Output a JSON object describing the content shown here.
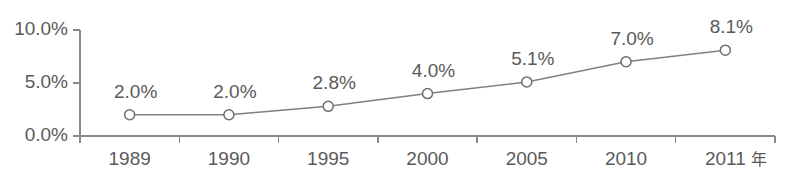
{
  "chart_data": {
    "type": "line",
    "title": "",
    "subtitle": "",
    "xlabel": "",
    "ylabel": "",
    "categories": [
      "1989",
      "1990",
      "1995",
      "2000",
      "2005",
      "2010",
      "2011"
    ],
    "values": [
      2.0,
      2.0,
      2.8,
      4.0,
      5.1,
      7.0,
      8.1
    ],
    "point_labels": [
      "2.0%",
      "2.0%",
      "2.8%",
      "4.0%",
      "5.1%",
      "7.0%",
      "8.1%"
    ],
    "x_tick_labels": [
      "1989",
      "1990",
      "1995",
      "2000",
      "2005",
      "2010",
      "2011"
    ],
    "x_axis_unit": "年",
    "y_tick_labels": [
      "0.0%",
      "5.0%",
      "10.0%"
    ],
    "y_tick_values": [
      0,
      5,
      10
    ],
    "ylim": [
      0,
      10
    ],
    "grid": false,
    "legend": false,
    "legend_position": "none",
    "series": [
      {
        "name": "",
        "values": [
          2.0,
          2.0,
          2.8,
          4.0,
          5.1,
          7.0,
          8.1
        ],
        "marker": "open-circle",
        "line_color": "#808080",
        "marker_fill": "#ffffff",
        "marker_stroke": "#6e6e6e"
      }
    ],
    "colors": {
      "axis": "#8a8a8a",
      "text": "#5a5a5a",
      "line": "#808080",
      "marker_fill": "#ffffff",
      "marker_stroke": "#6e6e6e",
      "background": "#ffffff"
    }
  },
  "layout": {
    "plot_left": 80,
    "plot_right": 775,
    "plot_top": 30,
    "plot_bottom": 136,
    "band_count": 7,
    "x_label_y": 160,
    "point_label_dy": -22,
    "point_label_dx": 6,
    "marker_radius": 5,
    "tick_length": 7
  }
}
